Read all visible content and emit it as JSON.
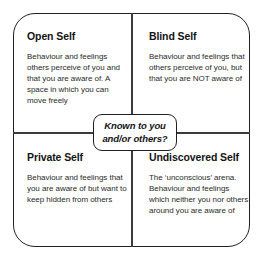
{
  "diagram": {
    "name": "Johari Window",
    "center_label": "Known to you and/or others?",
    "center_label_line1": "Known to you",
    "center_label_line2": "and/or others?",
    "colors": {
      "frame_stroke": "#231f20",
      "divider_stroke": "#3b3b3b",
      "background": "#ffffff",
      "title_text": "#141414",
      "body_text": "#2b2b2b"
    },
    "quadrants": [
      {
        "id": "open-self",
        "position": "top-left",
        "title": "Open Self",
        "body": "Behaviour and feelings others perceive of you and that you are aware of. A space in which you can move freely"
      },
      {
        "id": "blind-self",
        "position": "top-right",
        "title": "Blind Self",
        "body": "Behaviour and feelings that others perceive of you, but that you are NOT aware of"
      },
      {
        "id": "private-self",
        "position": "bottom-left",
        "title": "Private Self",
        "body": "Behaviour and feelings that you are aware of but want to keep hidden from others"
      },
      {
        "id": "undiscovered-self",
        "position": "bottom-right",
        "title": "Undiscovered Self",
        "body": "The ‘unconscious’ arena. Behaviour and feelings which neither you nor others around you are aware of"
      }
    ]
  }
}
